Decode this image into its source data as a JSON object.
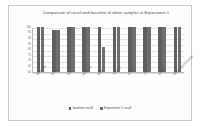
{
  "chart_data": {
    "type": "bar",
    "title": "Comparison of recall and baseline of white samples in Experiment 1",
    "xlabel": "",
    "ylabel": "",
    "ylim": [
      60,
      100
    ],
    "yticks": [
      100,
      95,
      90,
      85,
      80,
      75,
      70,
      65,
      60
    ],
    "grid": true,
    "legend_position": "bottom",
    "categories": [
      "Methanol",
      "Ethanol",
      "IPA",
      "Acetone",
      "MEK",
      "Toluene",
      "Xylene",
      "THF",
      "MTBE",
      "Methylene Chloride"
    ],
    "series": [
      {
        "name": "baseline recall",
        "color": "#5f5f5f",
        "values": [
          100,
          97,
          100,
          100,
          100,
          100,
          100,
          100,
          100,
          100
        ]
      },
      {
        "name": "Experiment 1 recall",
        "color": "#6e6e6e",
        "values": [
          100,
          97,
          100,
          100,
          82,
          100,
          100,
          100,
          100,
          100
        ]
      }
    ]
  }
}
